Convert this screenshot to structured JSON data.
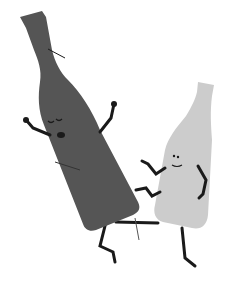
{
  "illustration": {
    "subject": "two cartoon bottles fighting",
    "colors": {
      "background": "#ffffff",
      "dark_bottle": "#555555",
      "light_bottle": "#cccccc",
      "limbs": "#1a1a1a"
    },
    "characters": [
      {
        "name": "wine-bottle",
        "expression": "eyes closed, mouth open (hurt)"
      },
      {
        "name": "beer-bottle",
        "expression": "smiling"
      }
    ]
  }
}
